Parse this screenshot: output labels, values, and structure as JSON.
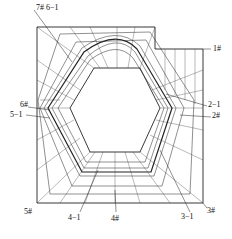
{
  "diagram": {
    "type": "finite-element mesh",
    "labels": [
      {
        "id": "7-6-1",
        "text": "7# 6−1",
        "x": 36,
        "y": 6
      },
      {
        "id": "1",
        "text": "1#",
        "x": 213,
        "y": 48
      },
      {
        "id": "2-1",
        "text": "2−1",
        "x": 208,
        "y": 103
      },
      {
        "id": "2",
        "text": "2#",
        "x": 212,
        "y": 114
      },
      {
        "id": "6",
        "text": "6#",
        "x": 20,
        "y": 104
      },
      {
        "id": "5-1",
        "text": "5−1",
        "x": 12,
        "y": 113
      },
      {
        "id": "5",
        "text": "5#",
        "x": 24,
        "y": 211
      },
      {
        "id": "4-1",
        "text": "4−1",
        "x": 69,
        "y": 216
      },
      {
        "id": "4",
        "text": "4#",
        "x": 111,
        "y": 217
      },
      {
        "id": "3-1",
        "text": "3−1",
        "x": 183,
        "y": 215
      },
      {
        "id": "3",
        "text": "3#",
        "x": 208,
        "y": 209
      }
    ]
  }
}
